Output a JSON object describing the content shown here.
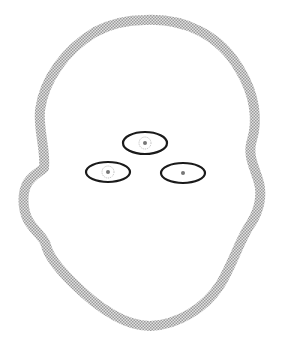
{
  "diagram": {
    "type": "face-outline-with-marked-regions",
    "background": "#ffffff",
    "outline": {
      "label": "head-outline",
      "stroke_color": "#b8b8b8",
      "stroke_width": 10,
      "style": "halftone-dotted"
    },
    "regions": [
      {
        "id": "forehead-glabella",
        "cx": 145,
        "cy": 143,
        "rx": 22,
        "ry": 11,
        "stroke": "#1a1a1a",
        "marker": "dotted-circle"
      },
      {
        "id": "left-cheek",
        "cx": 108,
        "cy": 172,
        "rx": 22,
        "ry": 10,
        "stroke": "#1a1a1a",
        "marker": "dotted-circle"
      },
      {
        "id": "right-cheek",
        "cx": 183,
        "cy": 173,
        "rx": 22,
        "ry": 10,
        "stroke": "#1a1a1a",
        "marker": "dotted-circle"
      }
    ]
  }
}
